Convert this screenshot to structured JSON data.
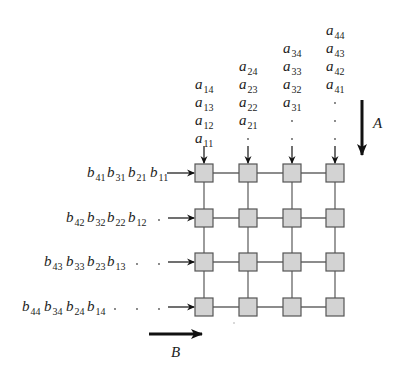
{
  "diagram": {
    "type": "systolic-array",
    "grid": {
      "rows": 4,
      "cols": 4,
      "cell_fill": "#d3d3d3",
      "cell_stroke": "#555555",
      "link_color": "#666666",
      "col_x": [
        195,
        239,
        283,
        326
      ],
      "row_y": [
        164,
        209,
        253,
        298
      ],
      "cell_size": 18
    },
    "a_columns": [
      {
        "labels": [
          "a",
          "a",
          "a",
          "a"
        ],
        "subs": [
          "14",
          "13",
          "12",
          "11"
        ],
        "dots": 0
      },
      {
        "labels": [
          "a",
          "a",
          "a",
          "a"
        ],
        "subs": [
          "24",
          "23",
          "22",
          "21"
        ],
        "dots": 1
      },
      {
        "labels": [
          "a",
          "a",
          "a",
          "a"
        ],
        "subs": [
          "34",
          "33",
          "32",
          "31"
        ],
        "dots": 2
      },
      {
        "labels": [
          "a",
          "a",
          "a",
          "a"
        ],
        "subs": [
          "44",
          "43",
          "42",
          "41"
        ],
        "dots": 3
      }
    ],
    "b_rows": [
      {
        "subs": [
          "41",
          "31",
          "21",
          "11"
        ],
        "dots": 0
      },
      {
        "subs": [
          "42",
          "32",
          "22",
          "12"
        ],
        "dots": 1
      },
      {
        "subs": [
          "43",
          "33",
          "23",
          "13"
        ],
        "dots": 2
      },
      {
        "subs": [
          "44",
          "34",
          "24",
          "14"
        ],
        "dots": 3
      }
    ],
    "flow_labels": {
      "A": "A",
      "B": "B"
    },
    "var_a": "a",
    "var_b": "b",
    "dot": "·"
  }
}
